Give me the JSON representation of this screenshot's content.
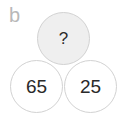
{
  "panel_label": "b",
  "circles": {
    "top": {
      "value": "?",
      "fill": "#efefef"
    },
    "bottom_left": {
      "value": "65",
      "fill": "#ffffff"
    },
    "bottom_right": {
      "value": "25",
      "fill": "#ffffff"
    }
  },
  "colors": {
    "stroke": "#d2d2d2",
    "label": "#b8b8b8",
    "text": "#2a2a2a"
  }
}
